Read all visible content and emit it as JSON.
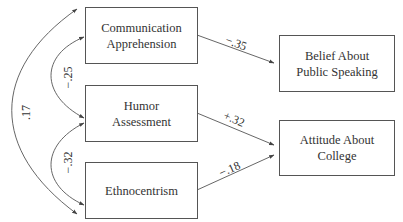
{
  "diagram": {
    "type": "path-model",
    "nodes": [
      {
        "id": "communication_apprehension",
        "label": "Communication\nApprehension",
        "role": "predictor"
      },
      {
        "id": "humor_assessment",
        "label": "Humor\nAssessment",
        "role": "predictor"
      },
      {
        "id": "ethnocentrism",
        "label": "Ethnocentrism",
        "role": "predictor"
      },
      {
        "id": "belief_public_speaking",
        "label": "Belief About\nPublic Speaking",
        "role": "outcome"
      },
      {
        "id": "attitude_college",
        "label": "Attitude About\nCollege",
        "role": "outcome"
      }
    ],
    "correlations": [
      {
        "from": "communication_apprehension",
        "to": "humor_assessment",
        "value": "−.25"
      },
      {
        "from": "humor_assessment",
        "to": "ethnocentrism",
        "value": "−.32"
      },
      {
        "from": "communication_apprehension",
        "to": "ethnocentrism",
        "value": ".17"
      }
    ],
    "paths": [
      {
        "from": "communication_apprehension",
        "to": "belief_public_speaking",
        "value": "−.35"
      },
      {
        "from": "humor_assessment",
        "to": "attitude_college",
        "value": "+.32"
      },
      {
        "from": "ethnocentrism",
        "to": "attitude_college",
        "value": "−.18"
      }
    ]
  },
  "colors": {
    "line": "#444444",
    "text": "#333333",
    "background": "#ffffff"
  }
}
